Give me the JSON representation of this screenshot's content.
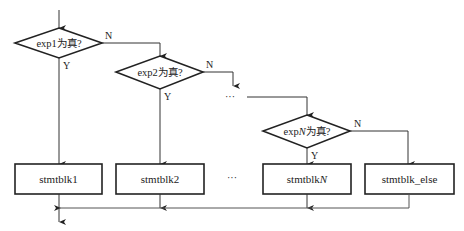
{
  "diagram": {
    "type": "flowchart",
    "decisions": [
      {
        "id": "d1",
        "prefix": "exp1",
        "italic": "",
        "suffix": "为真?",
        "yes": "Y",
        "no": "N"
      },
      {
        "id": "d2",
        "prefix": "exp2",
        "italic": "",
        "suffix": "为真?",
        "yes": "Y",
        "no": "N"
      },
      {
        "id": "dN",
        "prefix": "exp",
        "italic": "N",
        "suffix": "为真?",
        "yes": "Y",
        "no": "N"
      }
    ],
    "blocks": [
      {
        "id": "b1",
        "prefix": "stmtblk1",
        "italic": ""
      },
      {
        "id": "b2",
        "prefix": "stmtblk2",
        "italic": ""
      },
      {
        "id": "bN",
        "prefix": "stmtblk",
        "italic": "N"
      },
      {
        "id": "belse",
        "prefix": "stmtblk_else",
        "italic": ""
      }
    ],
    "ellipsis": "…",
    "ellipsis_between_decisions": "···",
    "ellipsis_between_blocks": "···"
  },
  "colors": {
    "stroke": "#222222",
    "thin_stroke": "#555555",
    "background": "#ffffff"
  }
}
